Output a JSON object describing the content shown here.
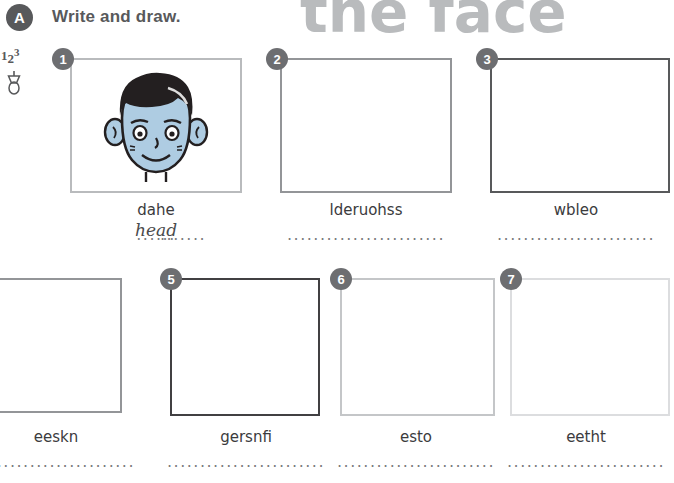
{
  "header": {
    "section_letter": "A",
    "instruction": "Write and draw.",
    "title": "the face"
  },
  "margin_icons": {
    "write_numbers": [
      "1",
      "2",
      "3"
    ],
    "draw_icon_name": "pencil-icon"
  },
  "items": [
    {
      "number": "1",
      "word": "dahe",
      "answer": "head",
      "dots_left": "......",
      "dots_right": ".......",
      "has_drawing": true,
      "drawing_name": "boy-face-illustration",
      "border_color": "#b9bbbd"
    },
    {
      "number": "2",
      "word": "lderuohss",
      "answer": "",
      "dots": "........................",
      "has_drawing": false,
      "border_color": "#939598"
    },
    {
      "number": "3",
      "word": "wbleo",
      "answer": "",
      "dots": "........................",
      "has_drawing": false,
      "border_color": "#58595b"
    },
    {
      "number": "4",
      "word": "",
      "answer": "",
      "dots": "",
      "has_drawing": false,
      "border_color": "#939598"
    },
    {
      "number": "5",
      "word": "gersnfi",
      "answer": "",
      "dots": "........................",
      "has_drawing": false,
      "border_color": "#414042"
    },
    {
      "number": "6",
      "word": "esto",
      "answer": "",
      "dots": "........................",
      "has_drawing": false,
      "border_color": "#c4c6c8"
    },
    {
      "number": "7",
      "word": "eetht",
      "answer": "",
      "dots": "........................",
      "has_drawing": false,
      "border_color": "#dcdddf"
    }
  ],
  "item_left_partial": {
    "number": "4",
    "word": "eeskn",
    "dots": "........................",
    "border_color": "#939598"
  },
  "colors": {
    "badge_gray": "#6d6e71",
    "title_gray": "#b9bbbd",
    "text_gray": "#58595b",
    "hair_dark": "#231f20",
    "skin": "#b8cfe0",
    "outline": "#231f20"
  }
}
